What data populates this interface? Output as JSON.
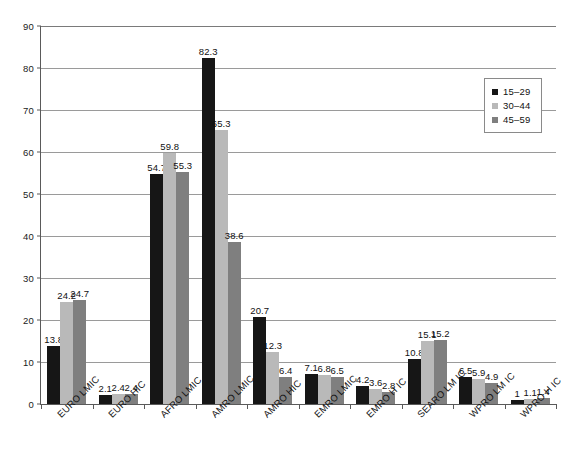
{
  "chart_data": {
    "type": "bar",
    "title": "",
    "subtitle": "",
    "xlabel": "",
    "ylabel": "",
    "ylim": [
      0,
      90
    ],
    "ytick_values": [
      0,
      10,
      20,
      30,
      40,
      50,
      60,
      70,
      80,
      90
    ],
    "ytick_labels": [
      "0",
      "10",
      "20",
      "30",
      "40",
      "50",
      "60",
      "70",
      "80",
      "90"
    ],
    "grid": true,
    "legend_position": "top-right",
    "categories": [
      "EURO LMIC",
      "EURO HIC",
      "AFRO LMIC",
      "AMRO LMIC",
      "AMRO HIC",
      "EMRO LMIC",
      "EMRO H IC",
      "SEARO LM IC",
      "WPRO LM IC",
      "WPRO H IC"
    ],
    "series": [
      {
        "name": "15–29",
        "color": "#161616",
        "values": [
          13.8,
          2.1,
          54.7,
          82.3,
          20.7,
          7.1,
          4.2,
          10.8,
          6.5,
          1
        ],
        "labels": [
          "13.8",
          "2.1",
          "54.7",
          "82.3",
          "20.7",
          "7.1",
          "4.2",
          "10.8",
          "6.5",
          "1"
        ]
      },
      {
        "name": "30–44",
        "color": "#b9b9b9",
        "values": [
          24.2,
          2.4,
          59.8,
          65.3,
          12.3,
          6.8,
          3.6,
          15.1,
          5.9,
          1.1
        ],
        "labels": [
          "24.2",
          "2.4",
          "59.8",
          "65.3",
          "12.3",
          "6.8",
          "3.6",
          "15.1",
          "5.9",
          "1.1"
        ]
      },
      {
        "name": "45–59",
        "color": "#7f7f7f",
        "values": [
          24.7,
          2.4,
          55.3,
          38.6,
          6.4,
          6.5,
          2.8,
          15.2,
          4.9,
          1.4
        ],
        "labels": [
          "24.7",
          "2.4",
          "55.3",
          "38.6",
          "6.4",
          "6.5",
          "2.8",
          "15.2",
          "4.9",
          "1.4"
        ]
      }
    ]
  },
  "legend": {
    "items": [
      {
        "label": "15–29",
        "color": "#161616"
      },
      {
        "label": "30–44",
        "color": "#b9b9b9"
      },
      {
        "label": "45–59",
        "color": "#7f7f7f"
      }
    ]
  }
}
